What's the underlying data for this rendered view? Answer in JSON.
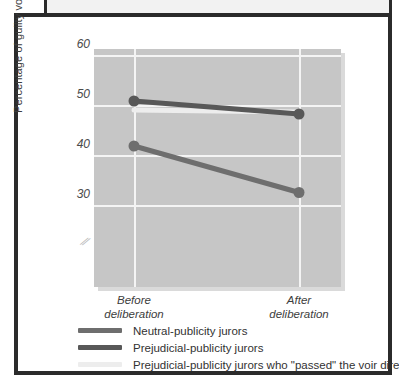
{
  "figure": {
    "caption_strip_text": ""
  },
  "chart_data": {
    "type": "line",
    "title": "",
    "xlabel": "",
    "ylabel": "Percentage of guilty votes",
    "categories": [
      "Before deliberation",
      "After deliberation"
    ],
    "category_lines": [
      [
        "Before",
        "deliberation"
      ],
      [
        "After",
        "deliberation"
      ]
    ],
    "ylim": [
      24,
      60
    ],
    "yticks": [
      30,
      40,
      50,
      60
    ],
    "ytick_labels": [
      "30",
      "40",
      "50",
      "60"
    ],
    "grid": true,
    "axis_break": true,
    "legend_position": "below",
    "series": [
      {
        "name": "Neutral-publicity jurors",
        "color": "#6e6e6e",
        "values": [
          41.8,
          32.5
        ],
        "markers": true
      },
      {
        "name": "Prejudicial-publicity jurors",
        "color": "#585858",
        "values": [
          50.8,
          48.2
        ],
        "markers": true
      },
      {
        "name": "Prejudicial-publicity jurors who \"passed\" the voir dire",
        "color": "#ededed",
        "values": [
          49.0,
          48.6
        ],
        "markers": false
      }
    ]
  },
  "colors": {
    "panel_background": "#c6c6c6",
    "gridline": "#f4f4f4",
    "frame": "#2b2b2b",
    "page_background": "#ffffff",
    "series_neutral": "#6e6e6e",
    "series_prejudicial": "#585858",
    "series_passed": "#ededed"
  }
}
